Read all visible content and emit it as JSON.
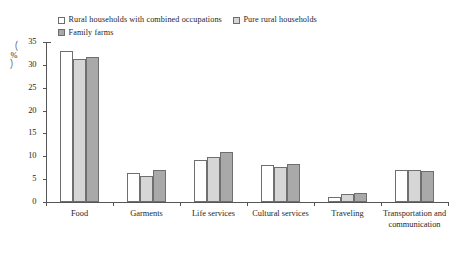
{
  "chart_data": {
    "type": "bar",
    "title": "",
    "xlabel": "",
    "ylabel": "(%)",
    "ylim": [
      0,
      35
    ],
    "yticks": [
      0,
      5,
      10,
      15,
      20,
      25,
      30,
      35
    ],
    "grid": false,
    "legend_position": "top",
    "categories": [
      "Food",
      "Garments",
      "Life services",
      "Cultural services",
      "Traveling",
      "Transportation and communication"
    ],
    "series": [
      {
        "name": "Rural households with combined occupations",
        "color": "#ffffff",
        "values": [
          33.0,
          6.4,
          9.2,
          8.2,
          1.0,
          7.1
        ]
      },
      {
        "name": "Pure rural households",
        "color": "#d6d6d6",
        "values": [
          31.3,
          5.6,
          9.8,
          7.7,
          1.7,
          7.1
        ]
      },
      {
        "name": "Family farms",
        "color": "#a9a9a9",
        "values": [
          31.8,
          7.0,
          11.0,
          8.4,
          2.0,
          6.8
        ]
      }
    ]
  },
  "axis": {
    "unit_open_paren": "（",
    "unit_text": "%",
    "unit_close_paren": "）"
  }
}
